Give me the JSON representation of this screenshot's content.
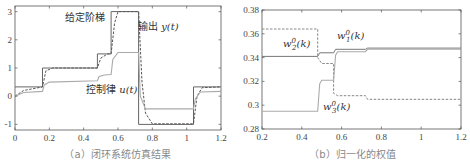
{
  "chart_data": [
    {
      "type": "line",
      "title": "",
      "caption": "（a）闭环系统仿真结果",
      "xlabel": "",
      "ylabel": "",
      "xlim": [
        0,
        1.2
      ],
      "ylim": [
        -1.2,
        3.2
      ],
      "xticks": [
        "0",
        "0.2",
        "0.4",
        "0.6",
        "0.8",
        "1",
        "1.2"
      ],
      "yticks": [
        "-1",
        "0",
        "1",
        "2",
        "3"
      ],
      "grid": false,
      "annotations": [
        "给定阶梯",
        "输出 y(t)",
        "控制律 u(t)"
      ],
      "series": [
        {
          "name": "给定阶梯",
          "style": "solid",
          "x": [
            0,
            0.16,
            0.16,
            0.48,
            0.48,
            0.56,
            0.56,
            0.72,
            0.72,
            1.04,
            1.04,
            1.2
          ],
          "y": [
            0.33,
            0.33,
            1.0,
            1.0,
            1.5,
            1.5,
            3.0,
            3.0,
            -1.0,
            -1.0,
            0.33,
            0.33
          ]
        },
        {
          "name": "输出 y(t)",
          "style": "dashed",
          "x": [
            0,
            0.05,
            0.16,
            0.18,
            0.22,
            0.48,
            0.5,
            0.54,
            0.56,
            0.58,
            0.6,
            0.72,
            0.74,
            0.76,
            0.8,
            1.04,
            1.06,
            1.09,
            1.2
          ],
          "y": [
            0.0,
            0.2,
            0.33,
            0.9,
            1.0,
            1.0,
            1.35,
            1.5,
            1.5,
            2.6,
            3.0,
            3.0,
            0.5,
            -0.6,
            -0.98,
            -0.98,
            0.0,
            0.3,
            0.33
          ]
        },
        {
          "name": "控制律 u(t)",
          "style": "solid-light",
          "x": [
            0,
            0.05,
            0.16,
            0.17,
            0.2,
            0.48,
            0.49,
            0.52,
            0.56,
            0.57,
            0.6,
            0.72,
            0.73,
            0.76,
            1.04,
            1.05,
            1.08,
            1.2
          ],
          "y": [
            0.0,
            0.13,
            0.17,
            0.4,
            0.5,
            0.55,
            0.7,
            0.75,
            0.77,
            1.3,
            1.55,
            1.55,
            0.0,
            -0.45,
            -0.45,
            -0.1,
            0.15,
            0.17
          ]
        }
      ]
    },
    {
      "type": "line",
      "title": "",
      "caption": "（b）归一化的权值",
      "xlabel": "",
      "ylabel": "",
      "xlim": [
        0.2,
        1.2
      ],
      "ylim": [
        0.28,
        0.38
      ],
      "xticks": [
        "0.2",
        "0.4",
        "0.6",
        "0.8",
        "1",
        "1.2"
      ],
      "yticks": [
        "0.28",
        "0.3",
        "0.32",
        "0.34",
        "0.36",
        "0.38"
      ],
      "grid": false,
      "annotations": [
        "w₁⁰(k)",
        "w₂⁰(k)",
        "w₃⁰(k)"
      ],
      "series": [
        {
          "name": "w1^0(k)",
          "style": "solid",
          "x": [
            0.2,
            0.48,
            0.49,
            0.56,
            0.57,
            0.72,
            0.73,
            1.2
          ],
          "y": [
            0.341,
            0.341,
            0.344,
            0.344,
            0.347,
            0.347,
            0.348,
            0.348
          ]
        },
        {
          "name": "w2^0(k)",
          "style": "dashed",
          "x": [
            0.2,
            0.48,
            0.48,
            0.5,
            0.56,
            0.56,
            0.58,
            0.72,
            0.73,
            1.2
          ],
          "y": [
            0.364,
            0.364,
            0.34,
            0.335,
            0.335,
            0.31,
            0.308,
            0.308,
            0.305,
            0.305
          ]
        },
        {
          "name": "w3^0(k)",
          "style": "solid-light",
          "x": [
            0.2,
            0.48,
            0.49,
            0.5,
            0.56,
            0.57,
            0.58,
            0.72,
            0.73,
            1.2
          ],
          "y": [
            0.295,
            0.295,
            0.318,
            0.321,
            0.321,
            0.342,
            0.345,
            0.345,
            0.347,
            0.347
          ]
        }
      ]
    }
  ],
  "panel_a": {
    "caption": "（a）闭环系统仿真结果",
    "label_setpoint": "给定阶梯",
    "label_output_prefix": "输出 ",
    "label_output_math": "y(t)",
    "label_control_prefix": "控制律 ",
    "label_control_math": "u(t)",
    "xticks": [
      "0",
      "0.2",
      "0.4",
      "0.6",
      "0.8",
      "1",
      "1.2"
    ],
    "yticks": [
      "-1",
      "0",
      "1",
      "2",
      "3"
    ]
  },
  "panel_b": {
    "caption": "（b）归一化的权值",
    "label_w1": "w",
    "label_w1_sup": "0",
    "label_w1_sub": "1",
    "label_w1_arg": "(k)",
    "label_w2": "w",
    "label_w2_sup": "0",
    "label_w2_sub": "2",
    "label_w2_arg": "(k)",
    "label_w3": "w",
    "label_w3_sup": "0",
    "label_w3_sub": "3",
    "label_w3_arg": "(k)",
    "xticks": [
      "0.2",
      "0.4",
      "0.6",
      "0.8",
      "1",
      "1.2"
    ],
    "yticks": [
      "0.28",
      "0.3",
      "0.32",
      "0.34",
      "0.36",
      "0.38"
    ]
  },
  "colors": {
    "axis": "#555555",
    "setpoint": "#666666",
    "output": "#555555",
    "control": "#aaaaaa",
    "w1": "#777777",
    "w2": "#888888",
    "w3": "#aaaaaa",
    "caption": "#888888"
  }
}
